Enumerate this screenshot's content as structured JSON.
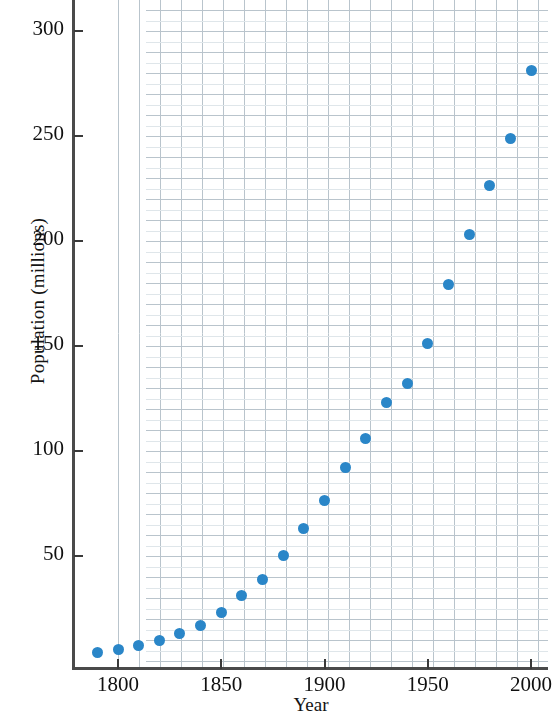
{
  "chart_data": {
    "type": "scatter",
    "title": "",
    "xlabel": "Year",
    "ylabel": "Population (millions)",
    "xlim": [
      1785,
      2005
    ],
    "ylim": [
      0,
      314
    ],
    "xticks": [
      1800,
      1850,
      1900,
      1950,
      2000
    ],
    "xtick_labels": [
      "1800",
      "1850",
      "1900",
      "1950",
      "2000"
    ],
    "yticks": [
      50,
      100,
      150,
      200,
      250,
      300
    ],
    "ytick_labels": [
      "50",
      "100",
      "150",
      "200",
      "250",
      "300"
    ],
    "grid": true,
    "grid_color": "#c9d3da",
    "minor_grid": true,
    "legend": "none",
    "marker_color": "#2a86c8",
    "marker_shape": "circle",
    "x": [
      1790,
      1800,
      1810,
      1820,
      1830,
      1840,
      1850,
      1860,
      1870,
      1880,
      1890,
      1900,
      1910,
      1920,
      1930,
      1940,
      1950,
      1960,
      1970,
      1980,
      1990,
      2000
    ],
    "y": [
      3.9,
      5.3,
      7.2,
      9.6,
      12.9,
      17.1,
      23.2,
      31.4,
      38.6,
      50.2,
      63.0,
      76.2,
      92.2,
      106.0,
      123.2,
      132.2,
      151.3,
      179.3,
      203.3,
      226.5,
      248.7,
      281.4
    ],
    "values": [
      {
        "year": 1790,
        "population": 3.9
      },
      {
        "year": 1800,
        "population": 5.3
      },
      {
        "year": 1810,
        "population": 7.2
      },
      {
        "year": 1820,
        "population": 9.6
      },
      {
        "year": 1830,
        "population": 12.9
      },
      {
        "year": 1840,
        "population": 17.1
      },
      {
        "year": 1850,
        "population": 23.2
      },
      {
        "year": 1860,
        "population": 31.4
      },
      {
        "year": 1870,
        "population": 38.6
      },
      {
        "year": 1880,
        "population": 50.2
      },
      {
        "year": 1890,
        "population": 63.0
      },
      {
        "year": 1900,
        "population": 76.2
      },
      {
        "year": 1910,
        "population": 92.2
      },
      {
        "year": 1920,
        "population": 106.0
      },
      {
        "year": 1930,
        "population": 123.2
      },
      {
        "year": 1940,
        "population": 132.2
      },
      {
        "year": 1950,
        "population": 151.3
      },
      {
        "year": 1960,
        "population": 179.3
      },
      {
        "year": 1970,
        "population": 203.3
      },
      {
        "year": 1980,
        "population": 226.5
      },
      {
        "year": 1990,
        "population": 248.7
      },
      {
        "year": 2000,
        "population": 281.4
      }
    ]
  }
}
